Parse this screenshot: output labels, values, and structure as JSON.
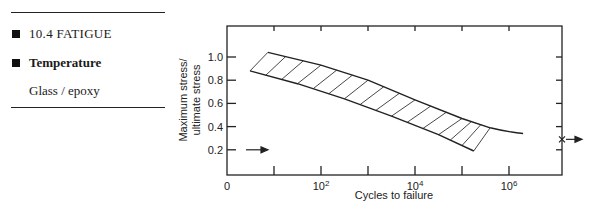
{
  "sidebar": {
    "section": "10.4  FATIGUE",
    "topic": "Temperature",
    "material": "Glass / epoxy"
  },
  "chart_data": {
    "type": "area",
    "title": "",
    "xlabel": "Cycles to failure",
    "ylabel": "Maximum stress/ ultimate stress",
    "ylabel_lines": [
      "Maximum stress/",
      "ultimate stress"
    ],
    "x_scale": "log10",
    "x_tick_labels": [
      "0",
      "10^2",
      "10^4",
      "10^6"
    ],
    "x_tick_labels_display": [
      {
        "base": "0",
        "exp": ""
      },
      {
        "base": "10",
        "exp": "2"
      },
      {
        "base": "10",
        "exp": "4"
      },
      {
        "base": "10",
        "exp": "6"
      }
    ],
    "y_tick_labels": [
      "0.2",
      "0.4",
      "0.6",
      "0.8",
      "1.0"
    ],
    "ylim": [
      0,
      1.3
    ],
    "xlim_log10": [
      0,
      7.1
    ],
    "grid": false,
    "series": [
      {
        "name": "Scatter band upper bound",
        "points": [
          [
            0.87,
            1.04
          ],
          [
            2.0,
            0.93
          ],
          [
            3.0,
            0.8
          ],
          [
            4.0,
            0.63
          ],
          [
            5.0,
            0.47
          ],
          [
            5.6,
            0.39
          ]
        ]
      },
      {
        "name": "Scatter band lower bound",
        "points": [
          [
            0.49,
            0.88
          ],
          [
            1.5,
            0.77
          ],
          [
            2.5,
            0.64
          ],
          [
            3.5,
            0.49
          ],
          [
            4.5,
            0.33
          ],
          [
            5.25,
            0.19
          ]
        ]
      },
      {
        "name": "Mean curve extension",
        "points": [
          [
            5.6,
            0.39
          ],
          [
            6.0,
            0.36
          ],
          [
            6.3,
            0.34
          ]
        ]
      }
    ],
    "annotations": [
      {
        "type": "arrow",
        "label": "left-arrow-marker",
        "y": 0.2,
        "side": "left"
      },
      {
        "type": "x-arrow",
        "label": "right-x-marker",
        "y": 0.29,
        "side": "right"
      }
    ]
  }
}
